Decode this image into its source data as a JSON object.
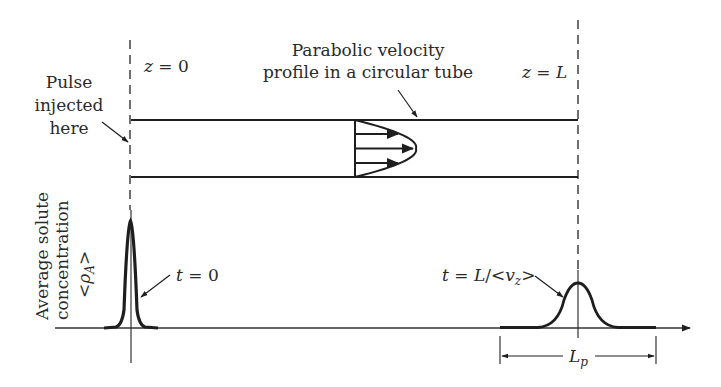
{
  "diagram": {
    "labels": {
      "z0": "z = 0",
      "zL": "z = L",
      "pulse_line1": "Pulse",
      "pulse_line2": "injected",
      "pulse_line3": "here",
      "profile_line1": "Parabolic velocity",
      "profile_line2": "profile in a circular tube",
      "yaxis_line1": "Average solute",
      "yaxis_line2": "concentration",
      "yaxis_line3": "<ρA>",
      "t0": "t = 0",
      "tL": "t = L/<vz>",
      "Lp": "Lp"
    },
    "colors": {
      "ink": "#1e1e1e",
      "background": "#ffffff"
    },
    "icons": [
      "arrow-icon",
      "dashed-line",
      "gaussian-peak"
    ]
  }
}
